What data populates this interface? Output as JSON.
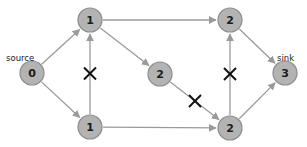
{
  "diagram": {
    "type": "flow-network",
    "nodes": [
      {
        "id": "n0",
        "label": "0",
        "x": 32,
        "y": 73,
        "annotation": "source"
      },
      {
        "id": "n1a",
        "label": "1",
        "x": 90,
        "y": 20
      },
      {
        "id": "n1b",
        "label": "1",
        "x": 90,
        "y": 127
      },
      {
        "id": "n2m",
        "label": "2",
        "x": 160,
        "y": 74
      },
      {
        "id": "n2a",
        "label": "2",
        "x": 230,
        "y": 20
      },
      {
        "id": "n2b",
        "label": "2",
        "x": 230,
        "y": 128
      },
      {
        "id": "n3",
        "label": "3",
        "x": 285,
        "y": 73,
        "annotation": "sink"
      }
    ],
    "edges": [
      {
        "from": "n0",
        "to": "n1a",
        "blocked": false
      },
      {
        "from": "n0",
        "to": "n1b",
        "blocked": false
      },
      {
        "from": "n1b",
        "to": "n1a",
        "blocked": true
      },
      {
        "from": "n1a",
        "to": "n2a",
        "blocked": false
      },
      {
        "from": "n1a",
        "to": "n2m",
        "blocked": false
      },
      {
        "from": "n1b",
        "to": "n2b",
        "blocked": false
      },
      {
        "from": "n2m",
        "to": "n2b",
        "blocked": true
      },
      {
        "from": "n2b",
        "to": "n2a",
        "blocked": true
      },
      {
        "from": "n2a",
        "to": "n3",
        "blocked": false
      },
      {
        "from": "n2b",
        "to": "n3",
        "blocked": false
      }
    ],
    "labels": {
      "source": "source",
      "sink": "sink"
    },
    "colors": {
      "node_fill": "#b3b3b3",
      "node_stroke": "#8c8c8c",
      "edge": "#9a9a9a",
      "cross": "#111111"
    }
  }
}
